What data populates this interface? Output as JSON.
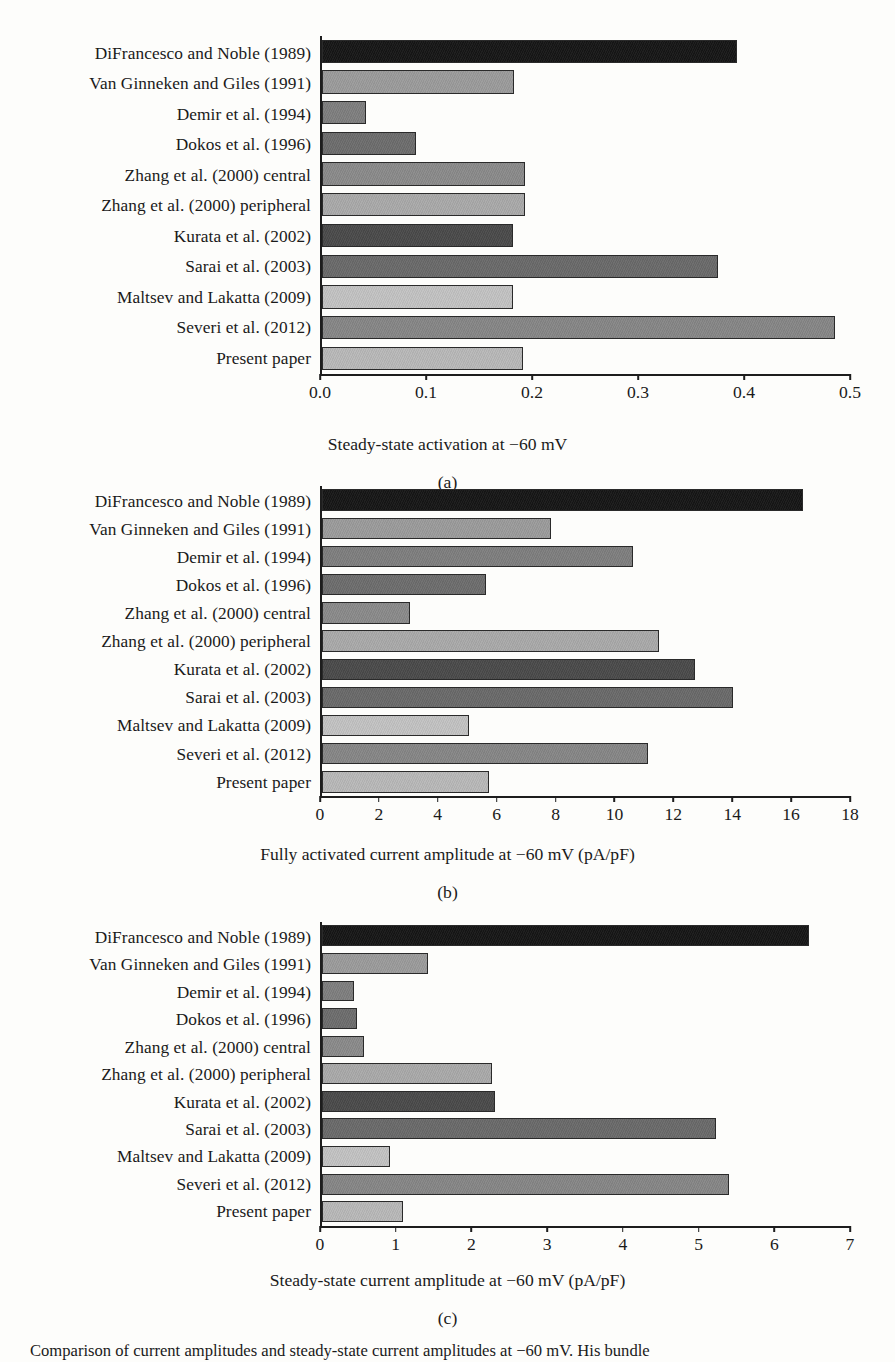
{
  "figure": {
    "caption_fragment": "Comparison of current amplitudes and steady-state current amplitudes at −60 mV. His bundle"
  },
  "chart_data": [
    {
      "type": "bar",
      "orientation": "horizontal",
      "panel": "(a)",
      "title": "",
      "xlabel": "Steady-state activation at −60 mV",
      "ylabel": "",
      "xlim": [
        0.0,
        0.5
      ],
      "xticks": [
        "0.0",
        "0.1",
        "0.2",
        "0.3",
        "0.4",
        "0.5"
      ],
      "xtick_values": [
        0.0,
        0.1,
        0.2,
        0.3,
        0.4,
        0.5
      ],
      "grid": false,
      "legend": "none",
      "categories": [
        "DiFrancesco and Noble (1989)",
        "Van Ginneken and Giles (1991)",
        "Demir et al. (1994)",
        "Dokos et al. (1996)",
        "Zhang et al. (2000) central",
        "Zhang et al. (2000) peripheral",
        "Kurata et al. (2002)",
        "Sarai et al. (2003)",
        "Maltsev and Lakatta (2009)",
        "Severi et al. (2012)",
        "Present paper"
      ],
      "values": [
        0.393,
        0.182,
        0.042,
        0.089,
        0.192,
        0.192,
        0.181,
        0.375,
        0.181,
        0.486,
        0.19
      ]
    },
    {
      "type": "bar",
      "orientation": "horizontal",
      "panel": "(b)",
      "title": "",
      "xlabel": "Fully activated current amplitude at −60 mV (pA/pF)",
      "ylabel": "",
      "xlim": [
        0,
        18
      ],
      "xticks": [
        "0",
        "2",
        "4",
        "6",
        "8",
        "10",
        "12",
        "14",
        "16",
        "18"
      ],
      "xtick_values": [
        0,
        2,
        4,
        6,
        8,
        10,
        12,
        14,
        16,
        18
      ],
      "grid": false,
      "legend": "none",
      "categories": [
        "DiFrancesco and Noble (1989)",
        "Van Ginneken and Giles (1991)",
        "Demir et al. (1994)",
        "Dokos et al. (1996)",
        "Zhang et al. (2000) central",
        "Zhang et al. (2000) peripheral",
        "Kurata et al. (2002)",
        "Sarai et al. (2003)",
        "Maltsev and Lakatta (2009)",
        "Severi et al. (2012)",
        "Present paper"
      ],
      "values": [
        16.4,
        7.8,
        10.6,
        5.6,
        3.0,
        11.5,
        12.7,
        14.0,
        5.0,
        11.1,
        5.7
      ]
    },
    {
      "type": "bar",
      "orientation": "horizontal",
      "panel": "(c)",
      "title": "",
      "xlabel": "Steady-state current amplitude at −60 mV (pA/pF)",
      "ylabel": "",
      "xlim": [
        0,
        7
      ],
      "xticks": [
        "0",
        "1",
        "2",
        "3",
        "4",
        "5",
        "6",
        "7"
      ],
      "xtick_values": [
        0,
        1,
        2,
        3,
        4,
        5,
        6,
        7
      ],
      "grid": false,
      "legend": "none",
      "categories": [
        "DiFrancesco and Noble (1989)",
        "Van Ginneken and Giles (1991)",
        "Demir et al. (1994)",
        "Dokos et al. (1996)",
        "Zhang et al. (2000) central",
        "Zhang et al. (2000) peripheral",
        "Kurata et al. (2002)",
        "Sarai et al. (2003)",
        "Maltsev and Lakatta (2009)",
        "Severi et al. (2012)",
        "Present paper"
      ],
      "values": [
        6.45,
        1.4,
        0.43,
        0.47,
        0.56,
        2.25,
        2.3,
        5.23,
        0.9,
        5.4,
        1.08
      ]
    }
  ],
  "bar_colors": [
    "#161616",
    "#9b9b9b",
    "#7e7e7e",
    "#6d6d6d",
    "#8a8a8a",
    "#a9a9a9",
    "#4a4a4a",
    "#6a6a6a",
    "#c2c2c2",
    "#868686",
    "#b8b8b8"
  ]
}
